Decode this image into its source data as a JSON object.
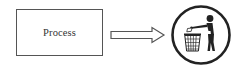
{
  "diagram": {
    "process_box": {
      "label": "Process"
    },
    "arrow": {
      "direction": "right",
      "style": "double-line-outline"
    },
    "target_icon": {
      "name": "tidyman-trash-icon",
      "description": "Person dropping litter into a waste bin, inside a circle"
    }
  },
  "colors": {
    "stroke": "#555555",
    "fill_dark": "#222222",
    "text": "#333333",
    "background": "#ffffff"
  }
}
